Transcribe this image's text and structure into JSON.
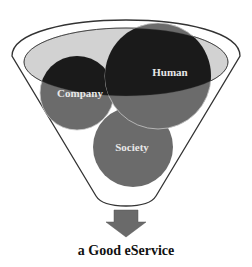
{
  "diagram": {
    "type": "funnel-venn",
    "circles": [
      {
        "id": "company",
        "label": "Company"
      },
      {
        "id": "human",
        "label": "Human"
      },
      {
        "id": "society",
        "label": "Society"
      }
    ],
    "output_label": "a Good eService"
  },
  "colors": {
    "funnel_outline": "#333333",
    "funnel_inner_ellipse": "#d2d2d2",
    "circle_dark": "#1a1a1a",
    "circle_gray": "#6b6b6b",
    "arrow": "#6a6a6a",
    "label_text": "#e8e8e8"
  }
}
